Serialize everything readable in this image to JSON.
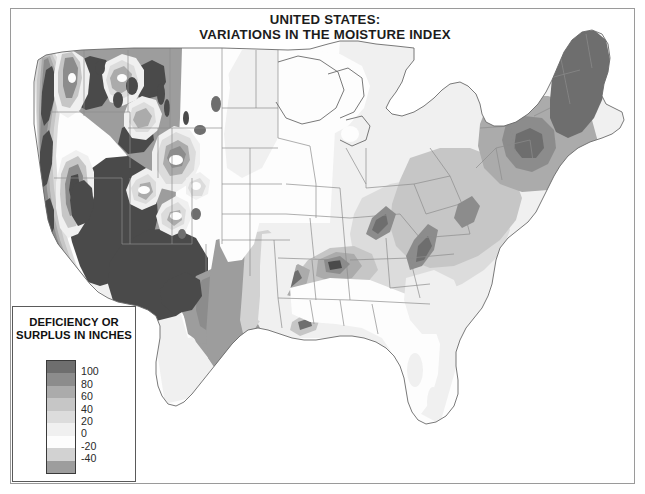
{
  "figure": {
    "kind": "thematic-contour-map",
    "title_lines": [
      "UNITED STATES:",
      "VARIATIONS IN THE MOISTURE INDEX"
    ],
    "background_color": "#ffffff",
    "frame_color": "#9a9a9a"
  },
  "legend": {
    "title_lines": [
      "DEFICIENCY OR",
      "SURPLUS IN INCHES"
    ],
    "box_border_color": "#5a5a5a",
    "labels": [
      "100",
      "80",
      "60",
      "40",
      "20",
      "0",
      "-20",
      "-40"
    ],
    "classes": [
      {
        "label": "above 100",
        "color": "#6e6e6e"
      },
      {
        "label": "80 to 100",
        "color": "#8c8c8c"
      },
      {
        "label": "60 to 80",
        "color": "#ababab"
      },
      {
        "label": "40 to 60",
        "color": "#c6c6c6"
      },
      {
        "label": "20 to 40",
        "color": "#dcdcdc"
      },
      {
        "label": "0 to 20",
        "color": "#f0f0f0"
      },
      {
        "label": "-20 to 0",
        "color": "#fdfdfd"
      },
      {
        "label": "-40 to -20",
        "color": "#d2d2d2"
      },
      {
        "label": "below -40",
        "color": "#9d9d9d"
      }
    ],
    "deep_deficit_color": "#4a4a4a"
  },
  "map": {
    "region": "Conterminous United States",
    "boundary_line_color": "#707070",
    "state_line_color": "#8d8d8d",
    "coast_line_color": "#6a6a6a"
  },
  "chart_data": {
    "type": "heatmap",
    "title": "UNITED STATES: VARIATIONS IN THE MOISTURE INDEX",
    "xlabel": "",
    "ylabel": "",
    "legend_title": "DEFICIENCY OR SURPLUS IN INCHES",
    "unit": "inches",
    "legend_position": "bottom-left",
    "grid": false,
    "tick_labels": [
      "100",
      "80",
      "60",
      "40",
      "20",
      "0",
      "-20",
      "-40"
    ],
    "class_breaks": [
      -40,
      -20,
      0,
      20,
      40,
      60,
      80,
      100
    ],
    "value_range": [
      -60,
      120
    ],
    "classes": [
      {
        "range": "above 100",
        "color": "#6e6e6e"
      },
      {
        "range": "80 to 100",
        "color": "#8c8c8c"
      },
      {
        "range": "60 to 80",
        "color": "#ababab"
      },
      {
        "range": "40 to 60",
        "color": "#c6c6c6"
      },
      {
        "range": "20 to 40",
        "color": "#dcdcdc"
      },
      {
        "range": "0 to 20",
        "color": "#f0f0f0"
      },
      {
        "range": "-20 to 0",
        "color": "#fdfdfd"
      },
      {
        "range": "-40 to -20",
        "color": "#d2d2d2"
      },
      {
        "range": "below -40",
        "color": "#9d9d9d"
      }
    ],
    "regional_readings": [
      {
        "region": "Pacific Northwest coast",
        "value": 100
      },
      {
        "region": "Cascade Range crest",
        "value": 110
      },
      {
        "region": "Columbia Basin",
        "value": -30
      },
      {
        "region": "Northern Rockies",
        "value": 60
      },
      {
        "region": "Great Basin (Nevada)",
        "value": -45
      },
      {
        "region": "Sierra Nevada crest",
        "value": 90
      },
      {
        "region": "Central Valley California",
        "value": -40
      },
      {
        "region": "Southern California desert",
        "value": -50
      },
      {
        "region": "Arizona desert",
        "value": -50
      },
      {
        "region": "Colorado Rockies",
        "value": 50
      },
      {
        "region": "Wasatch Range Utah",
        "value": 45
      },
      {
        "region": "High Plains (Nebraska)",
        "value": -10
      },
      {
        "region": "West Texas",
        "value": -45
      },
      {
        "region": "South Texas",
        "value": -40
      },
      {
        "region": "East Texas",
        "value": 5
      },
      {
        "region": "Upper Midwest",
        "value": 5
      },
      {
        "region": "Great Lakes",
        "value": 15
      },
      {
        "region": "Ohio Valley",
        "value": 20
      },
      {
        "region": "Appalachian Mountains",
        "value": 55
      },
      {
        "region": "Southern Appalachians",
        "value": 75
      },
      {
        "region": "Adirondacks New York",
        "value": 85
      },
      {
        "region": "Northern New England",
        "value": 70
      },
      {
        "region": "Gulf Coast",
        "value": 15
      },
      {
        "region": "Florida peninsula",
        "value": 10
      },
      {
        "region": "Carolina coastal plain",
        "value": 20
      }
    ]
  }
}
